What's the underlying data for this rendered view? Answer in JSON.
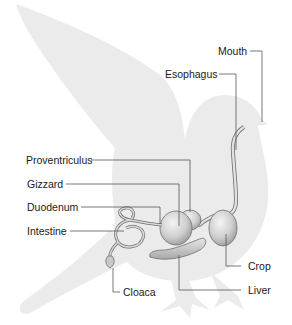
{
  "diagram": {
    "colors": {
      "silhouette": "#ebebeb",
      "organ": "#d6d6d6",
      "organ_stroke": "#6e6e6e",
      "leader": "#555555",
      "text": "#1a1a1a"
    },
    "labels": [
      {
        "id": "mouth",
        "text": "Mouth"
      },
      {
        "id": "esophagus",
        "text": "Esophagus"
      },
      {
        "id": "proventriculus",
        "text": "Proventriculus"
      },
      {
        "id": "gizzard",
        "text": "Gizzard"
      },
      {
        "id": "duodenum",
        "text": "Duodenum"
      },
      {
        "id": "intestine",
        "text": "Intestine"
      },
      {
        "id": "crop",
        "text": "Crop"
      },
      {
        "id": "cloaca",
        "text": "Cloaca"
      },
      {
        "id": "liver",
        "text": "Liver"
      }
    ]
  }
}
